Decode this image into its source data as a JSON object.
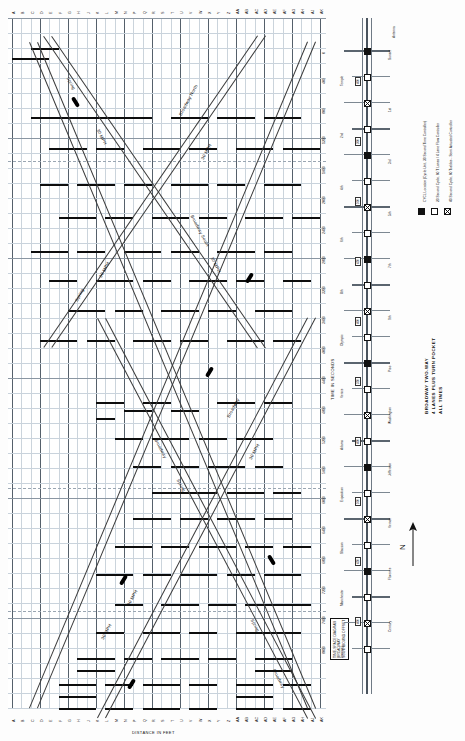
{
  "sheet": {
    "title_lines": [
      "BROADWAY  TWO-WAY",
      "4 LANES PLUS TURN POCKET",
      "ALL TIMES"
    ],
    "orientation_note": "N"
  },
  "chart": {
    "type": "time-space-diagram",
    "x_axis_title": "DISTANCE IN FEET",
    "y_axis_title": "DISTANCE IN FEET",
    "time_axis_title": "TIME IN SECONDS",
    "cycle_label": "CYCLE",
    "note_box": [
      "TIME-SPACE DIAGRAM",
      "BROADWAY",
      "SOUTHBOUND OFFSET"
    ],
    "top_tick_labels": [
      "A",
      "B",
      "C",
      "D",
      "E",
      "F",
      "G",
      "H",
      "J",
      "K",
      "L",
      "M",
      "N",
      "P",
      "Q",
      "R",
      "S",
      "T",
      "U",
      "V",
      "W",
      "X",
      "Y",
      "Z",
      "AA",
      "AB",
      "AC",
      "AD",
      "AE",
      "AF",
      "AG",
      "AH",
      "AJ",
      "AK"
    ],
    "bottom_tick_labels": [
      "A",
      "B",
      "C",
      "D",
      "E",
      "F",
      "G",
      "H",
      "J",
      "K",
      "L",
      "M",
      "N",
      "P",
      "Q",
      "R",
      "S",
      "T",
      "U",
      "V",
      "W",
      "X",
      "Y",
      "Z",
      "AA",
      "AB",
      "AC",
      "AD",
      "AE",
      "AF",
      "AG",
      "AH",
      "AJ",
      "AK"
    ],
    "distance_labels": [
      "0",
      "400",
      "800",
      "1200",
      "1600",
      "2000",
      "2400",
      "2800",
      "3200",
      "3600",
      "4000",
      "4400",
      "4800",
      "5200",
      "5600",
      "6000",
      "6400",
      "6800",
      "7200",
      "7600",
      "8000"
    ],
    "trace_labels": [
      "Broadway  North",
      "30 MPH",
      "Broadway  South",
      "30 MPH",
      "Spring",
      "30 MPH",
      "Broadway",
      "30 MPH",
      "Spring",
      "30 MPH",
      "Broadway",
      "Spring",
      "30 MPH",
      "30 MPH",
      "Spring",
      "Broadway"
    ]
  },
  "plan": {
    "corridor_name": "BROADWAY",
    "antenna_label": "Antenna",
    "cross_streets": [
      "Sunset",
      "Temple",
      "1st",
      "2nd",
      "3rd",
      "4th",
      "5th",
      "6th",
      "7th",
      "8th",
      "9th",
      "Olympic",
      "Pico",
      "Venice",
      "Washington",
      "Adams",
      "Jefferson",
      "Exposition",
      "Vernon",
      "Slauson",
      "Florence",
      "Manchester",
      "Century",
      "Imperial"
    ],
    "block_labels": [
      "400",
      "300",
      "500",
      "450",
      "400",
      "350",
      "400",
      "500",
      "450",
      "400"
    ]
  },
  "legend": {
    "items": [
      {
        "symbol": "filled-square",
        "text": "CYCL Location (Cycle Unit, 30 Second Time Controller)"
      },
      {
        "symbol": "open-square",
        "text": "20 Second Cycle, 60 T Lanes / 4 Lane Flow Controller"
      },
      {
        "symbol": "xed-square",
        "text": "40 Second Cycle, 60 Tcables - Semi Actuated Controller"
      }
    ]
  }
}
